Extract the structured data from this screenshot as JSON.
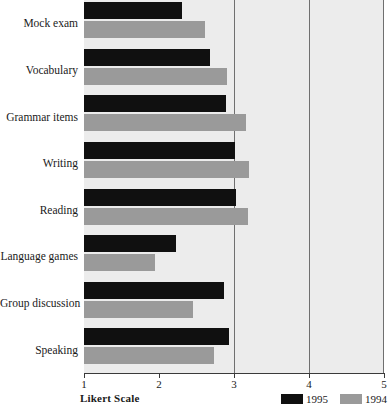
{
  "chart_data": {
    "type": "bar",
    "orientation": "horizontal",
    "title": "",
    "subtitle": "",
    "xlabel": "Likert Scale",
    "ylabel": "",
    "xlim": [
      1,
      5
    ],
    "xticks": [
      1,
      2,
      3,
      4,
      5
    ],
    "xtick_labels": [
      "1",
      "2",
      "3",
      "4",
      "5"
    ],
    "grid": true,
    "gridlines_at": [
      3,
      4
    ],
    "legend_position": "bottom-right",
    "categories": [
      "Mock exam",
      "Vocabulary",
      "Grammar items",
      "Writing",
      "Reading",
      "Language games",
      "Group discussion",
      "Speaking"
    ],
    "series": [
      {
        "name": "1995",
        "color": "#101010",
        "values": [
          2.31,
          2.68,
          2.89,
          3.01,
          3.02,
          2.23,
          2.86,
          2.93
        ]
      },
      {
        "name": "1994",
        "color": "#9a9a9a",
        "values": [
          2.61,
          2.9,
          3.16,
          3.2,
          3.19,
          1.95,
          2.45,
          2.73
        ]
      }
    ]
  },
  "axis": {
    "x_title": "Likert Scale"
  },
  "legend": {
    "entries": [
      {
        "label": "1995",
        "color": "#101010"
      },
      {
        "label": "1994",
        "color": "#9a9a9a"
      }
    ]
  },
  "colors": {
    "series_1995": "#101010",
    "series_1994": "#9a9a9a",
    "plot_background": "#ececec",
    "gridline": "#6f6f6f",
    "axis": "#3a3a3a",
    "page_background": "#ffffff"
  }
}
